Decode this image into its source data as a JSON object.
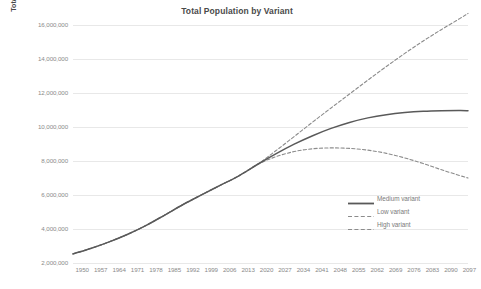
{
  "chart_data": {
    "type": "line",
    "title": "Total Population by Variant",
    "xlabel": "",
    "ylabel": "Total Population (millions)",
    "grid": true,
    "legend_position": "inside-right",
    "xlim": [
      1950,
      2100
    ],
    "ylim": [
      2000000,
      16000000
    ],
    "y_ticks": [
      2000000,
      4000000,
      6000000,
      8000000,
      10000000,
      12000000,
      14000000,
      16000000
    ],
    "y_tick_labels": [
      "2,000,000",
      "4,000,000",
      "6,000,000",
      "8,000,000",
      "10,000,000",
      "12,000,000",
      "14,000,000",
      "16,000,000"
    ],
    "x_ticks": [
      1950,
      1957,
      1964,
      1971,
      1978,
      1985,
      1992,
      1999,
      2006,
      2013,
      2020,
      2027,
      2034,
      2041,
      2048,
      2055,
      2062,
      2069,
      2076,
      2083,
      2090,
      2097
    ],
    "x_tick_labels": [
      "1950",
      "1957",
      "1964",
      "1971",
      "1978",
      "1985",
      "1992",
      "1999",
      "2006",
      "2013",
      "2020",
      "2027",
      "2034",
      "2041",
      "2048",
      "2055",
      "2062",
      "2069",
      "2076",
      "2083",
      "2090",
      "2097"
    ],
    "x": [
      1950,
      1957,
      1964,
      1971,
      1978,
      1985,
      1992,
      1999,
      2006,
      2013,
      2020,
      2027,
      2034,
      2041,
      2048,
      2055,
      2062,
      2069,
      2076,
      2083,
      2090,
      2097,
      2100
    ],
    "series": [
      {
        "name": "Medium variant",
        "style": "solid",
        "color": "#595959",
        "values": [
          2536000,
          2872000,
          3258000,
          3706000,
          4231000,
          4836000,
          5457000,
          6024000,
          6577000,
          7130000,
          7795000,
          8419000,
          8990000,
          9489000,
          9917000,
          10270000,
          10537000,
          10725000,
          10849000,
          10923000,
          10956000,
          10965000,
          10960000
        ]
      },
      {
        "name": "Low variant",
        "style": "dashed",
        "color": "#8c8c8c",
        "values": [
          2536000,
          2872000,
          3258000,
          3706000,
          4231000,
          4836000,
          5457000,
          6024000,
          6577000,
          7130000,
          7795000,
          8250000,
          8555000,
          8720000,
          8770000,
          8740000,
          8637000,
          8450000,
          8180000,
          7850000,
          7480000,
          7140000,
          7000000
        ]
      },
      {
        "name": "High variant",
        "style": "dashed",
        "color": "#8c8c8c",
        "values": [
          2536000,
          2872000,
          3258000,
          3706000,
          4231000,
          4836000,
          5457000,
          6024000,
          6577000,
          7130000,
          7795000,
          8600000,
          9440000,
          10290000,
          11120000,
          11940000,
          12760000,
          13560000,
          14330000,
          15060000,
          15740000,
          16390000,
          16680000
        ]
      }
    ]
  },
  "legend": {
    "items": [
      {
        "label": "Medium variant",
        "style": "solid"
      },
      {
        "label": "Low variant",
        "style": "dashed"
      },
      {
        "label": "High variant",
        "style": "dashed"
      }
    ]
  },
  "colors": {
    "medium": "#595959",
    "low": "#8c8c8c",
    "high": "#8c8c8c",
    "grid": "#e8e8e8",
    "tick_text": "#8a8a8a",
    "title_text": "#4a4a4a"
  }
}
